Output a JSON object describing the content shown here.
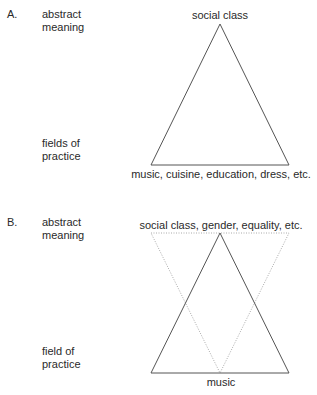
{
  "panel_a": {
    "letter": "A.",
    "row_top_label_1": "abstract",
    "row_top_label_2": "meaning",
    "row_bottom_label_1": "fields of",
    "row_bottom_label_2": "practice",
    "apex_label": "social class",
    "base_label": "music, cuisine, education, dress, etc."
  },
  "panel_b": {
    "letter": "B.",
    "row_top_label_1": "abstract",
    "row_top_label_2": "meaning",
    "row_bottom_label_1": "field of",
    "row_bottom_label_2": "practice",
    "top_label": "social class, gender, equality, etc.",
    "base_label": "music"
  },
  "colors": {
    "solid_line": "#555555",
    "dotted_line": "#aaaaaa",
    "text": "#2a2a2a"
  }
}
